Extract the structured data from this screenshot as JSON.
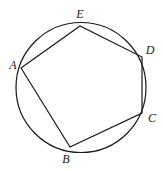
{
  "figure": {
    "type": "inscribed-polygon",
    "background_color": "#ffffff",
    "stroke_color": "#1a1a1a",
    "label_color": "#1a1a1a",
    "stroke_width": 1.2,
    "circle": {
      "name": "circumscribed-circle",
      "cx": 81,
      "cy": 87.5,
      "r": 65
    },
    "polygon": {
      "name": "inscribed-pentagon",
      "order": [
        "A",
        "E",
        "D",
        "C",
        "B"
      ],
      "fill": "none"
    },
    "vertices": [
      {
        "id": "A",
        "label": "A",
        "x": 21,
        "y": 68,
        "label_x": 13,
        "label_y": 65
      },
      {
        "id": "E",
        "label": "E",
        "x": 80,
        "y": 26,
        "label_x": 80,
        "label_y": 14
      },
      {
        "id": "D",
        "label": "D",
        "x": 142,
        "y": 57,
        "label_x": 150,
        "label_y": 50
      },
      {
        "id": "C",
        "label": "C",
        "x": 142,
        "y": 113,
        "label_x": 152,
        "label_y": 118
      },
      {
        "id": "B",
        "label": "B",
        "x": 70,
        "y": 147,
        "label_x": 66,
        "label_y": 159
      }
    ],
    "edges": [
      {
        "name": "segment-A-E",
        "from": "A",
        "to": "E"
      },
      {
        "name": "segment-E-D",
        "from": "E",
        "to": "D"
      },
      {
        "name": "segment-D-C",
        "from": "D",
        "to": "C"
      },
      {
        "name": "segment-C-B",
        "from": "C",
        "to": "B"
      },
      {
        "name": "segment-B-A",
        "from": "B",
        "to": "A"
      }
    ]
  }
}
